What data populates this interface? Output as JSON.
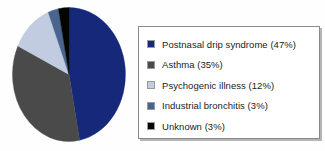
{
  "chart_data": {
    "type": "pie",
    "title": "",
    "subtitle": "",
    "xlabel": "",
    "ylabel": "",
    "legend_position": "right",
    "grid": false,
    "start_angle_deg": 0,
    "direction": "clockwise",
    "categories": [
      "Postnasal drip syndrome",
      "Asthma",
      "Psychogenic illness",
      "Industrial bronchitis",
      "Unknown"
    ],
    "values": [
      47,
      35,
      12,
      3,
      3
    ],
    "value_unit": "%",
    "colors": [
      "#16287a",
      "#4a4a4a",
      "#c2cce0",
      "#4a6490",
      "#050505"
    ],
    "slices": [
      {
        "label": "Postnasal drip syndrome",
        "value": 47,
        "legend_text": "Postnasal drip syndrome (47%)",
        "color": "#16287a"
      },
      {
        "label": "Asthma",
        "value": 35,
        "legend_text": "Asthma (35%)",
        "color": "#4a4a4a"
      },
      {
        "label": "Psychogenic illness",
        "value": 12,
        "legend_text": "Psychogenic illness (12%)",
        "color": "#c2cce0"
      },
      {
        "label": "Industrial bronchitis",
        "value": 3,
        "legend_text": "Industrial bronchitis (3%)",
        "color": "#4a6490"
      },
      {
        "label": "Unknown",
        "value": 3,
        "legend_text": "Unknown (3%)",
        "color": "#050505"
      }
    ]
  },
  "legend": {
    "items": [
      {
        "text": "Postnasal drip syndrome (47%)",
        "color": "#16287a"
      },
      {
        "text": "Asthma (35%)",
        "color": "#4a4a4a"
      },
      {
        "text": "Psychogenic illness (12%)",
        "color": "#c2cce0"
      },
      {
        "text": "Industrial bronchitis (3%)",
        "color": "#4a6490"
      },
      {
        "text": "Unknown (3%)",
        "color": "#050505"
      }
    ]
  },
  "colors": {
    "background": "#fefefe",
    "legend_border": "#8a8a8a",
    "legend_shadow": "#b5b5b5",
    "swatch_border": "#9a9a9a",
    "text": "#1b1b1b"
  }
}
